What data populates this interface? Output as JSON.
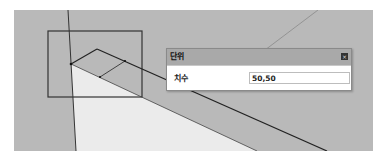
{
  "viewport": {
    "background_color": "#b9b9b9",
    "light_face_color": "#ebebeb",
    "line_color": "#222222",
    "guide_line_color": "#555555"
  },
  "dialog": {
    "title": "단위",
    "close_icon": "close-icon",
    "field_label": "치수",
    "field_value": "50,50"
  }
}
